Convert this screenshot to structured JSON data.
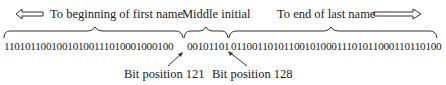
{
  "figure": {
    "labels": {
      "first_name": "To beginning of first name",
      "middle_initial": "Middle initial",
      "last_name": "To end of last name"
    },
    "bits": {
      "first_segment": "11010110010010100111010001000100",
      "middle_segment": "00101101",
      "last_segment": "0110011010110010100011101011000110110100"
    },
    "annotations": {
      "start_marker": "Bit position 121",
      "end_marker": "Bit position 128"
    },
    "arrows": {
      "left": "hollow-left-arrow",
      "right": "hollow-right-arrow"
    },
    "colors": {
      "ink": "#1a1a1a",
      "background": "#ffffff"
    }
  }
}
